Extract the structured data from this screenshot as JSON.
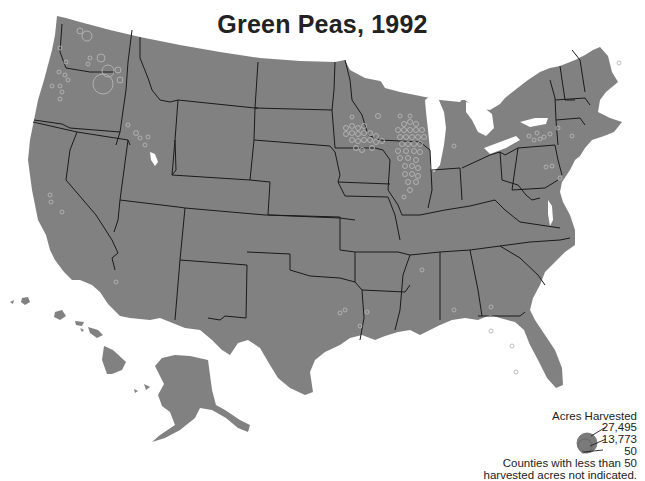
{
  "title": "Green Peas, 1992",
  "legend": {
    "heading": "Acres Harvested",
    "values": [
      "27,495",
      "13,773",
      "50"
    ],
    "note_line1": "Counties with less than 50",
    "note_line2": "harvested acres not indicated."
  },
  "colors": {
    "land": "#818181",
    "border": "#1a1a1a",
    "symbol_outline": "#b5b5b5",
    "background": "#ffffff"
  },
  "map": {
    "region": "United States",
    "symbol": "proportional circle per county",
    "concentrations": [
      "Washington",
      "Oregon",
      "Idaho",
      "Minnesota",
      "Wisconsin",
      "Illinois",
      "New York"
    ]
  }
}
